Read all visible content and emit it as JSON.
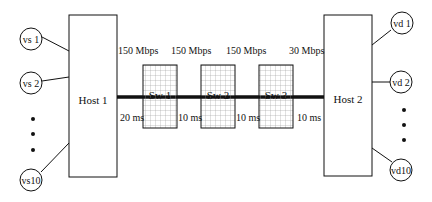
{
  "diagram": {
    "type": "network-topology",
    "hosts": [
      {
        "id": "host1",
        "label": "Host 1"
      },
      {
        "id": "host2",
        "label": "Host 2"
      }
    ],
    "switches": [
      {
        "id": "sw1",
        "label": "Sw 1"
      },
      {
        "id": "sw2",
        "label": "Sw 2"
      },
      {
        "id": "sw3",
        "label": "Sw 3"
      }
    ],
    "sources": [
      {
        "id": "vs1",
        "label": "vs 1"
      },
      {
        "id": "vs2",
        "label": "vs 2"
      },
      {
        "id": "vs10",
        "label": "vs10"
      }
    ],
    "destinations": [
      {
        "id": "vd1",
        "label": "vd 1"
      },
      {
        "id": "vd2",
        "label": "vd 2"
      },
      {
        "id": "vd10",
        "label": "vd10"
      }
    ],
    "links": [
      {
        "from": "host1",
        "to": "sw1",
        "bandwidth": "150 Mbps",
        "delay": "20 ms"
      },
      {
        "from": "sw1",
        "to": "sw2",
        "bandwidth": "150 Mbps",
        "delay": "10 ms"
      },
      {
        "from": "sw2",
        "to": "sw3",
        "bandwidth": "150 Mbps",
        "delay": "10 ms"
      },
      {
        "from": "sw3",
        "to": "host2",
        "bandwidth": "30 Mbps",
        "delay": "10 ms"
      }
    ],
    "ellipsis": "•"
  }
}
